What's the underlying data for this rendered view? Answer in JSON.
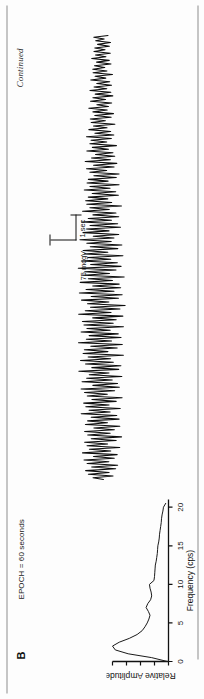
{
  "figure": {
    "panel_label": "B",
    "continued_note": "Continued",
    "epoch_label": "EPOCH = 60 seconds"
  },
  "calibration": {
    "amplitude_label": "75 mcgV",
    "time_label": "1 sec",
    "amplitude_value": 75,
    "amplitude_unit": "mcgV",
    "time_value": 1,
    "time_unit": "sec"
  },
  "chart_data": [
    {
      "type": "line",
      "title": "EEG trace",
      "xlabel": "",
      "ylabel": "",
      "grid": false,
      "legend": "none",
      "xlim": [
        0,
        1
      ],
      "ylim": [
        -1,
        1
      ],
      "note": "Continuous high-frequency EEG waveform, 60 second epoch, amplitude calibrated by 75 mcgV / 1 sec marker",
      "x": [
        0,
        0.004,
        0.008,
        0.012,
        0.016,
        0.02,
        0.024,
        0.028,
        0.032,
        0.036,
        0.04,
        0.044,
        0.048,
        0.052,
        0.056,
        0.06,
        0.064,
        0.068,
        0.072,
        0.076,
        0.08,
        0.084,
        0.088,
        0.092,
        0.096,
        0.1,
        0.104,
        0.108,
        0.112,
        0.116,
        0.12,
        0.124,
        0.128,
        0.132,
        0.136,
        0.14,
        0.144,
        0.148,
        0.152,
        0.156,
        0.16,
        0.164,
        0.168,
        0.172,
        0.176,
        0.18,
        0.184,
        0.188,
        0.192,
        0.196,
        0.2,
        0.204,
        0.208,
        0.212,
        0.216,
        0.22,
        0.224,
        0.228,
        0.232,
        0.236,
        0.24,
        0.244,
        0.248,
        0.252,
        0.256,
        0.26,
        0.264,
        0.268,
        0.272,
        0.276,
        0.28,
        0.284,
        0.288,
        0.292,
        0.296,
        0.3,
        0.304,
        0.308,
        0.312,
        0.316,
        0.32,
        0.324,
        0.328,
        0.332,
        0.336,
        0.34,
        0.344,
        0.348,
        0.352,
        0.356,
        0.36,
        0.364,
        0.368,
        0.372,
        0.376,
        0.38,
        0.384,
        0.388,
        0.392,
        0.396,
        0.4,
        0.404,
        0.408,
        0.412,
        0.416,
        0.42,
        0.424,
        0.428,
        0.432,
        0.436,
        0.44,
        0.444,
        0.448,
        0.452,
        0.456,
        0.46,
        0.464,
        0.468,
        0.472,
        0.476,
        0.48,
        0.484,
        0.488,
        0.492,
        0.496,
        0.5,
        0.504,
        0.508,
        0.512,
        0.516,
        0.52,
        0.524,
        0.528,
        0.532,
        0.536,
        0.54,
        0.544,
        0.548,
        0.552,
        0.556,
        0.56,
        0.564,
        0.568,
        0.572,
        0.576,
        0.58,
        0.584,
        0.588,
        0.592,
        0.596,
        0.6,
        0.604,
        0.608,
        0.612,
        0.616,
        0.62,
        0.624,
        0.628,
        0.632,
        0.636,
        0.64,
        0.644,
        0.648,
        0.652,
        0.656,
        0.66,
        0.664,
        0.668,
        0.672,
        0.676,
        0.68,
        0.684,
        0.688,
        0.692,
        0.696,
        0.7,
        0.704,
        0.708,
        0.712,
        0.716,
        0.72,
        0.724,
        0.728,
        0.732,
        0.736,
        0.74,
        0.744,
        0.748,
        0.752,
        0.756,
        0.76,
        0.764,
        0.768,
        0.772,
        0.776,
        0.78,
        0.784,
        0.788,
        0.792,
        0.796,
        0.8,
        0.804,
        0.808,
        0.812,
        0.816,
        0.82,
        0.824,
        0.828,
        0.832,
        0.836,
        0.84,
        0.844,
        0.848,
        0.852,
        0.856,
        0.86,
        0.864,
        0.868,
        0.872,
        0.876,
        0.88,
        0.884,
        0.888,
        0.892,
        0.896,
        0.9,
        0.904,
        0.908,
        0.912,
        0.916,
        0.92,
        0.924,
        0.928,
        0.932,
        0.936,
        0.94,
        0.944,
        0.948,
        0.952,
        0.956,
        0.96,
        0.964,
        0.968,
        0.972,
        0.976,
        0.98,
        0.984,
        0.988,
        0.992,
        0.996,
        1
      ],
      "y": [
        -0.08,
        0.34,
        -0.46,
        0.52,
        -0.3,
        0.62,
        -0.55,
        0.38,
        -0.62,
        0.55,
        -0.28,
        0.66,
        -0.48,
        0.3,
        -0.58,
        0.7,
        -0.34,
        0.44,
        -0.66,
        0.52,
        -0.22,
        0.6,
        -0.52,
        0.36,
        -0.7,
        0.48,
        -0.3,
        0.58,
        -0.44,
        0.26,
        -0.62,
        0.54,
        -0.2,
        0.46,
        -0.58,
        0.34,
        -0.5,
        0.66,
        -0.28,
        0.4,
        -0.6,
        0.5,
        -0.24,
        0.56,
        -0.46,
        0.3,
        -0.64,
        0.44,
        -0.18,
        0.52,
        -0.4,
        0.62,
        -0.54,
        0.26,
        -0.48,
        0.58,
        -0.32,
        0.44,
        -0.6,
        0.36,
        -0.22,
        0.66,
        -0.5,
        0.28,
        -0.56,
        0.46,
        -0.34,
        0.6,
        -0.26,
        0.38,
        -0.62,
        0.52,
        -0.18,
        0.48,
        -0.44,
        0.3,
        -0.58,
        0.64,
        -0.28,
        0.42,
        -0.54,
        0.34,
        -0.46,
        0.56,
        -0.24,
        0.4,
        -0.6,
        0.48,
        -0.32,
        0.52,
        -0.4,
        0.24,
        -0.58,
        0.62,
        -0.26,
        0.44,
        -0.5,
        0.3,
        -0.64,
        0.38,
        -0.2,
        0.54,
        -0.46,
        0.28,
        -0.56,
        0.6,
        -0.34,
        0.42,
        -0.52,
        0.24,
        -0.48,
        0.58,
        -0.3,
        0.36,
        -0.62,
        0.5,
        -0.22,
        0.46,
        -0.4,
        0.64,
        -0.54,
        0.3,
        -0.44,
        0.56,
        -0.26,
        0.38,
        -0.6,
        0.48,
        -0.18,
        0.52,
        -0.46,
        0.32,
        -0.58,
        0.42,
        -0.28,
        0.62,
        -0.36,
        0.24,
        -0.5,
        0.54,
        -0.22,
        0.44,
        -0.56,
        0.34,
        -0.48,
        0.6,
        -0.3,
        0.4,
        -0.52,
        0.26,
        -0.44,
        0.58,
        -0.24,
        0.36,
        -0.62,
        0.46,
        -0.32,
        0.5,
        -0.2,
        0.42,
        -0.54,
        0.3,
        -0.46,
        0.56,
        -0.28,
        0.38,
        -0.58,
        0.48,
        -0.22,
        0.44,
        -0.5,
        0.26,
        -0.6,
        0.4,
        -0.18,
        0.52,
        -0.44,
        0.28,
        -0.54,
        0.58,
        -0.32,
        0.36,
        -0.48,
        0.22,
        -0.42,
        0.54,
        -0.26,
        0.34,
        -0.56,
        0.44,
        -0.2,
        0.4,
        -0.38,
        0.58,
        -0.48,
        0.26,
        -0.36,
        0.5,
        -0.22,
        0.32,
        -0.54,
        0.42,
        -0.16,
        0.46,
        -0.4,
        0.28,
        -0.5,
        0.36,
        -0.24,
        0.54,
        -0.3,
        0.2,
        -0.44,
        0.48,
        -0.18,
        0.38,
        -0.5,
        0.28,
        -0.42,
        0.52,
        -0.24,
        0.34,
        -0.46,
        0.22,
        -0.38,
        0.5,
        -0.2,
        0.3,
        -0.52,
        0.4,
        -0.26,
        0.42,
        -0.16,
        0.34,
        -0.46,
        0.24,
        -0.38,
        0.48,
        -0.22,
        0.3,
        -0.44,
        0.38,
        -0.18,
        0.34,
        -0.4,
        0.2,
        -0.46,
        0.3,
        -0.14,
        0.4,
        -0.34,
        0.22,
        -0.42,
        0.44,
        -0.24,
        0.28,
        -0.36,
        0.16,
        -0.32,
        0.4,
        -0.2,
        0.26,
        -0.42,
        0.32,
        -0.15,
        0.3,
        -0.28,
        0.42,
        -0.34,
        0.18,
        -0.26,
        0.36,
        -0.16,
        0.22,
        -0.38,
        0.28,
        -0.12,
        0.3,
        -0.24,
        0.18
      ]
    },
    {
      "type": "line",
      "title": "Power spectrum",
      "xlabel": "Frequency (cps)",
      "ylabel": "Relative Amplitude",
      "grid": false,
      "legend": "none",
      "xlim": [
        0,
        21
      ],
      "ylim": [
        0,
        1
      ],
      "xticks": [
        0,
        5,
        10,
        15,
        20
      ],
      "xtick_labels": [
        "0",
        "5",
        "10",
        "15",
        "20"
      ],
      "ytick_count": 5,
      "x": [
        0,
        0.5,
        1,
        1.5,
        2,
        2.5,
        3,
        3.5,
        4,
        4.5,
        5,
        5.5,
        6,
        6.5,
        7,
        7.5,
        8,
        8.5,
        9,
        9.5,
        10,
        10.5,
        11,
        11.5,
        12,
        12.5,
        13,
        13.5,
        14,
        14.5,
        15,
        15.5,
        16,
        16.5,
        17,
        17.5,
        18,
        18.5,
        19,
        19.5,
        20,
        20.5
      ],
      "y": [
        0.02,
        0.3,
        0.72,
        0.95,
        1.0,
        0.88,
        0.7,
        0.56,
        0.47,
        0.42,
        0.38,
        0.35,
        0.33,
        0.36,
        0.4,
        0.37,
        0.32,
        0.3,
        0.31,
        0.33,
        0.34,
        0.26,
        0.25,
        0.245,
        0.24,
        0.235,
        0.22,
        0.21,
        0.2,
        0.195,
        0.19,
        0.175,
        0.165,
        0.16,
        0.15,
        0.14,
        0.13,
        0.125,
        0.115,
        0.1,
        0.09,
        0.05
      ]
    }
  ]
}
